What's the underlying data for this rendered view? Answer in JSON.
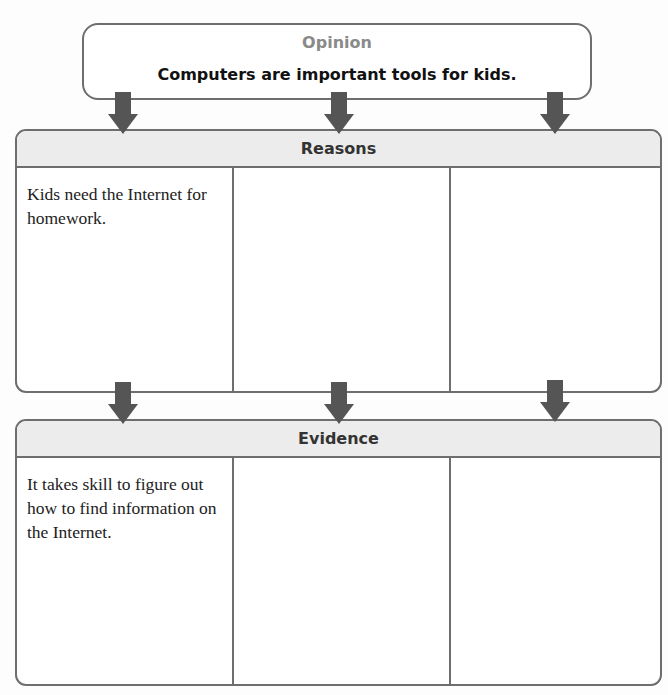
{
  "opinion": {
    "title": "Opinion",
    "statement": "Computers are important tools for kids."
  },
  "reasons": {
    "title": "Reasons",
    "cells": [
      "Kids need the Internet for homework.",
      "",
      ""
    ]
  },
  "evidence": {
    "title": "Evidence",
    "cells": [
      "It takes skill to figure out how to find information on the Internet.",
      "",
      ""
    ]
  },
  "colors": {
    "border": "#6e6e6e",
    "arrow": "#555555",
    "header_fill": "#ececec",
    "opinion_title": "#8a8a8a"
  }
}
